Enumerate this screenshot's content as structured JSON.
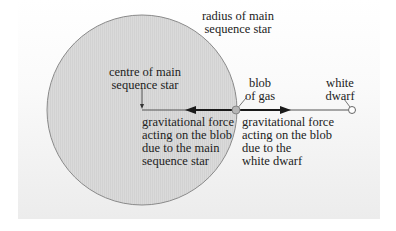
{
  "diagram": {
    "colors": {
      "panel_top": "#ffffff",
      "panel_bottom": "#ececec",
      "star_fill": "#d9d9d9",
      "star_outline": "#8a8a8a",
      "line": "#555555",
      "arrow": "#1a1a1a",
      "blob_fill": "#b5b5b5",
      "white_dwarf_fill": "#ffffff",
      "text": "#222222"
    },
    "labels": {
      "radius": {
        "line1": "radius of main",
        "line2": "sequence star"
      },
      "centre": {
        "line1": "centre of main",
        "line2": "sequence star"
      },
      "blob": {
        "line1": "blob",
        "line2": "of gas"
      },
      "white_dwarf": {
        "line1": "white",
        "line2": "dwarf"
      },
      "force_main": {
        "line1": "gravitational force",
        "line2": "acting on the blob",
        "line3": "due to the main",
        "line4": "sequence star"
      },
      "force_dwarf": {
        "line1": "gravitational force",
        "line2": "acting on the blob",
        "line3": "due to the",
        "line4": "white dwarf"
      }
    },
    "objects": {
      "main_sequence_star": {
        "cx": 142,
        "cy": 110,
        "r": 95
      },
      "blob_of_gas": {
        "cx": 236,
        "cy": 110,
        "r": 4
      },
      "white_dwarf": {
        "cx": 352,
        "cy": 110,
        "r": 4
      }
    }
  }
}
